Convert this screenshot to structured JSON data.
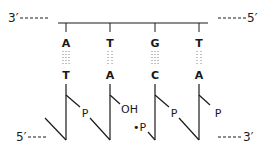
{
  "diagram": {
    "top_strand": {
      "left_end": "3′",
      "right_end": "5′",
      "bases": [
        "A",
        "T",
        "G",
        "T"
      ]
    },
    "bottom_strand": {
      "left_end": "5′",
      "right_end": "3′",
      "bases": [
        "T",
        "A",
        "C",
        "A"
      ],
      "backbone_labels": [
        "P",
        "OH",
        "•P",
        "P",
        "P"
      ]
    },
    "colors": {
      "ink": "#1a1a1a",
      "background": "#ffffff"
    }
  }
}
